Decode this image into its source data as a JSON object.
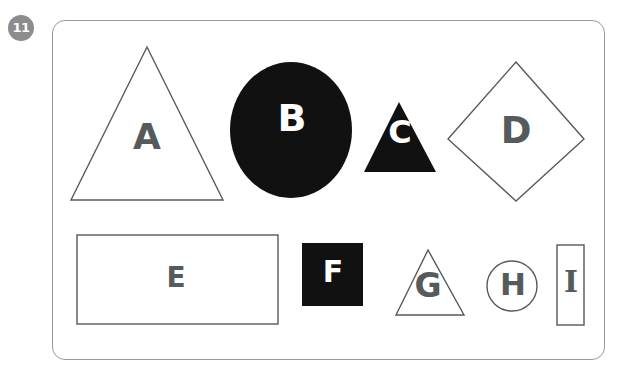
{
  "page": {
    "question_number": "11",
    "badge_color": "#8c8c8c",
    "badge_text_color": "#ffffff",
    "card_border_color": "#9a9a9a",
    "background_color": "#ffffff"
  },
  "palette": {
    "outline": "#555a5d",
    "fill_black": "#111111",
    "letter_dark": "#555a5d",
    "letter_light": "#ffffff"
  },
  "shapes": [
    {
      "id": "A",
      "label": "A",
      "type": "triangle",
      "style": "outline",
      "letter_color": "#555a5d",
      "row": 1
    },
    {
      "id": "B",
      "label": "B",
      "type": "circle",
      "style": "filled",
      "letter_color": "#ffffff",
      "row": 1
    },
    {
      "id": "C",
      "label": "C",
      "type": "triangle",
      "style": "filled",
      "letter_color": "#ffffff",
      "row": 1
    },
    {
      "id": "D",
      "label": "D",
      "type": "diamond",
      "style": "outline",
      "letter_color": "#555a5d",
      "row": 1
    },
    {
      "id": "E",
      "label": "E",
      "type": "rectangle",
      "style": "outline",
      "letter_color": "#555a5d",
      "row": 2
    },
    {
      "id": "F",
      "label": "F",
      "type": "square",
      "style": "filled",
      "letter_color": "#ffffff",
      "row": 2
    },
    {
      "id": "G",
      "label": "G",
      "type": "triangle",
      "style": "outline",
      "letter_color": "#555a5d",
      "row": 2
    },
    {
      "id": "H",
      "label": "H",
      "type": "circle",
      "style": "outline",
      "letter_color": "#555a5d",
      "row": 2
    },
    {
      "id": "I",
      "label": "I",
      "type": "rectangle",
      "style": "outline",
      "letter_color": "#555a5d",
      "row": 2
    }
  ]
}
